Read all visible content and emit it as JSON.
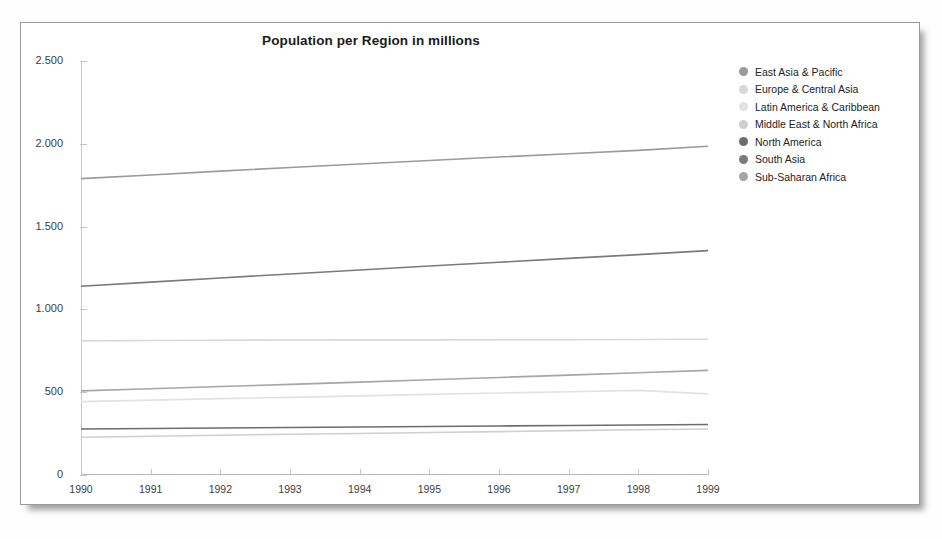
{
  "chart_data": {
    "type": "line",
    "title": "Population per Region in millions",
    "xlabel": "",
    "ylabel": "",
    "x": [
      1990,
      1991,
      1992,
      1993,
      1994,
      1995,
      1996,
      1997,
      1998,
      1999
    ],
    "xtick_labels": [
      "1990",
      "1991",
      "1992",
      "1993",
      "1994",
      "1995",
      "1996",
      "1997",
      "1998",
      "1999"
    ],
    "ytick_labels": [
      "0",
      "500",
      "1.000",
      "1.500",
      "2.000",
      "2.500"
    ],
    "ytick_values": [
      0,
      500,
      1000,
      1500,
      2000,
      2500
    ],
    "ylim": [
      0,
      2500
    ],
    "xlim": [
      1990,
      1999
    ],
    "grid": false,
    "legend_position": "right",
    "series": [
      {
        "name": "East Asia & Pacific",
        "color": "#9a9a9a",
        "values": [
          1790,
          1812,
          1835,
          1857,
          1878,
          1899,
          1920,
          1940,
          1960,
          1985
        ]
      },
      {
        "name": "Europe & Central Asia",
        "color": "#d8d8d8",
        "values": [
          810,
          812,
          814,
          815,
          816,
          816,
          817,
          817,
          818,
          820
        ]
      },
      {
        "name": "Latin America & Caribbean",
        "color": "#e2e2e2",
        "values": [
          443,
          452,
          461,
          469,
          478,
          487,
          495,
          503,
          511,
          490
        ]
      },
      {
        "name": "Middle East & North Africa",
        "color": "#cfcfcf",
        "values": [
          228,
          234,
          240,
          246,
          251,
          257,
          262,
          268,
          273,
          278
        ]
      },
      {
        "name": "North America",
        "color": "#6d6d6d",
        "values": [
          278,
          281,
          284,
          287,
          290,
          293,
          296,
          299,
          302,
          305
        ]
      },
      {
        "name": "South Asia",
        "color": "#7a7a7a",
        "values": [
          1140,
          1165,
          1190,
          1214,
          1238,
          1262,
          1285,
          1308,
          1331,
          1355
        ]
      },
      {
        "name": "Sub-Saharan Africa",
        "color": "#a6a6a6",
        "values": [
          508,
          521,
          534,
          547,
          561,
          575,
          589,
          603,
          617,
          632
        ]
      }
    ]
  }
}
